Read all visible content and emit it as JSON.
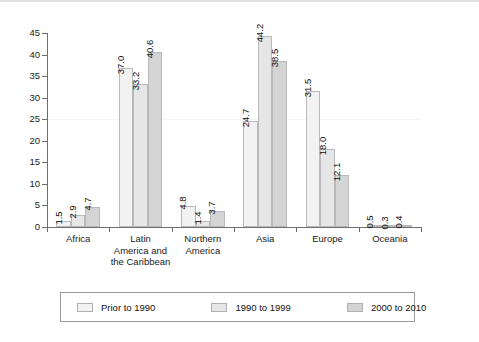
{
  "chart_data": {
    "type": "bar",
    "title": "",
    "subtitle": "",
    "xlabel": "",
    "ylabel": "",
    "ylim": [
      0,
      45
    ],
    "yticks": [
      0,
      5,
      10,
      15,
      20,
      25,
      30,
      35,
      40,
      45
    ],
    "grid": false,
    "legend_position": "bottom",
    "orientation": "vertical",
    "grouping": "clustered",
    "value_label_rotation": 90,
    "categories": [
      "Africa",
      "Latin America and the Caribbean",
      "Northern America",
      "Asia",
      "Europe",
      "Oceania"
    ],
    "category_lines": [
      [
        "Africa"
      ],
      [
        "Latin",
        "America and",
        "the Caribbean"
      ],
      [
        "Northern",
        "America"
      ],
      [
        "Asia"
      ],
      [
        "Europe"
      ],
      [
        "Oceania"
      ]
    ],
    "series": [
      {
        "name": "Prior to 1990",
        "color": "#f2f2f2",
        "values": [
          1.5,
          37.0,
          4.8,
          24.7,
          31.5,
          0.5
        ],
        "labels": [
          "1.5",
          "37.0",
          "4.8",
          "24.7",
          "31.5",
          "0.5"
        ]
      },
      {
        "name": "1990 to 1999",
        "color": "#e6e6e6",
        "values": [
          2.9,
          33.2,
          1.4,
          44.2,
          18.0,
          0.3
        ],
        "labels": [
          "2.9",
          "33.2",
          "1.4",
          "44.2",
          "18.0",
          "0.3"
        ]
      },
      {
        "name": "2000 to 2010",
        "color": "#d4d4d4",
        "values": [
          4.7,
          40.6,
          3.7,
          38.5,
          12.1,
          0.4
        ],
        "labels": [
          "4.7",
          "40.6",
          "3.7",
          "38.5",
          "12.1",
          "0.4"
        ]
      }
    ]
  },
  "axis": {
    "y_tick_labels": [
      "45",
      "40",
      "35",
      "30",
      "25",
      "20",
      "15",
      "10",
      "5",
      "0"
    ]
  },
  "legend": {
    "entries": [
      {
        "label": "Prior to 1990",
        "color": "#f2f2f2"
      },
      {
        "label": "1990 to 1999",
        "color": "#e6e6e6"
      },
      {
        "label": "2000 to 2010",
        "color": "#d4d4d4"
      }
    ]
  },
  "colors": {
    "axis": "#6f6f6f",
    "bar_outline": "#b9b9b9",
    "text": "#111111",
    "legend_border": "#9a9a9a",
    "top_rule": "#e2e2e2"
  }
}
